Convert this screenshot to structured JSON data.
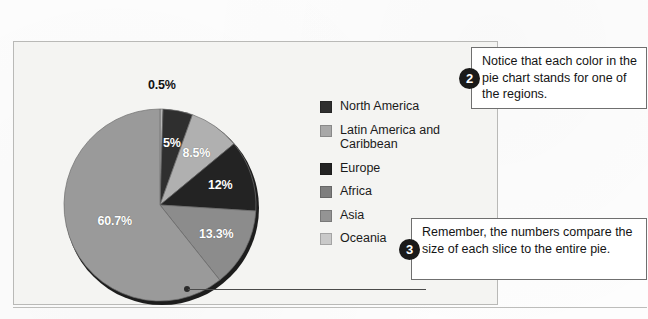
{
  "figure": {
    "panel_bg": "#f4f4f2",
    "panel_border": "#b9b9b7"
  },
  "chart_data": {
    "type": "pie",
    "title": "",
    "subtitle": "",
    "xlabel": "",
    "ylabel": "",
    "grid": false,
    "legend_position": "right",
    "units": "percent",
    "start_angle_deg": 0,
    "direction": "clockwise",
    "categories": [
      "North America",
      "Latin America and Caribbean",
      "Europe",
      "Africa",
      "Asia",
      "Oceania"
    ],
    "slices": [
      {
        "label": "Oceania",
        "value": 0.5,
        "display": "0.5%",
        "color": "#b6b6b6",
        "label_color": "dark"
      },
      {
        "label": "North America",
        "value": 5.0,
        "display": "5%",
        "color": "#2f2f2f",
        "label_color": "light"
      },
      {
        "label": "Latin America and Caribbean",
        "value": 8.5,
        "display": "8.5%",
        "color": "#b0b0b0",
        "label_color": "light"
      },
      {
        "label": "Europe",
        "value": 12.0,
        "display": "12%",
        "color": "#232323",
        "label_color": "light"
      },
      {
        "label": "Africa",
        "value": 13.3,
        "display": "13.3%",
        "color": "#8c8c8c",
        "label_color": "light"
      },
      {
        "label": "Asia",
        "value": 60.7,
        "display": "60.7%",
        "color": "#9a9a9a",
        "label_color": "light"
      }
    ],
    "values": [
      0.5,
      5.0,
      8.5,
      12.0,
      13.3,
      60.7
    ],
    "data_labels": [
      "0.5%",
      "5%",
      "8.5%",
      "12%",
      "13.3%",
      "60.7%"
    ],
    "total": 100.0
  },
  "legend": {
    "items": [
      {
        "label": "North America",
        "color": "#2f2f2f"
      },
      {
        "label": "Latin America and Caribbean",
        "color": "#a8a8a8"
      },
      {
        "label": "Europe",
        "color": "#232323"
      },
      {
        "label": "Africa",
        "color": "#7e7e7e"
      },
      {
        "label": "Asia",
        "color": "#949494"
      },
      {
        "label": "Oceania",
        "color": "#c9c9c9"
      }
    ]
  },
  "callouts": [
    {
      "number": "2",
      "text": "Notice that each color in the pie chart stands for one of the regions."
    },
    {
      "number": "3",
      "text": "Remember, the numbers compare the size of each slice to the entire pie."
    }
  ]
}
